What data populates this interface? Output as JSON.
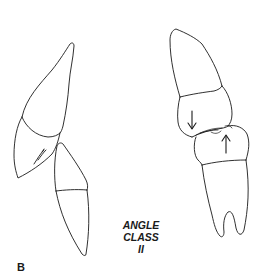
{
  "figure": {
    "panel_label": "B",
    "caption_lines": [
      "ANGLE",
      "CLASS",
      "II"
    ],
    "stroke_color": "#1a1a1a",
    "background": "#ffffff",
    "elements": [
      {
        "id": "upper-incisor",
        "description": "Proclined maxillary incisor (lateral view)"
      },
      {
        "id": "lower-incisor",
        "description": "Mandibular incisor (lateral view)"
      },
      {
        "id": "upper-molar",
        "description": "Maxillary first molar"
      },
      {
        "id": "lower-molar",
        "description": "Mandibular first molar with bifurcated root"
      },
      {
        "id": "arrow-down",
        "description": "Downward arrow on upper molar crown"
      },
      {
        "id": "arrow-up",
        "description": "Upward arrow on lower molar crown"
      }
    ]
  }
}
